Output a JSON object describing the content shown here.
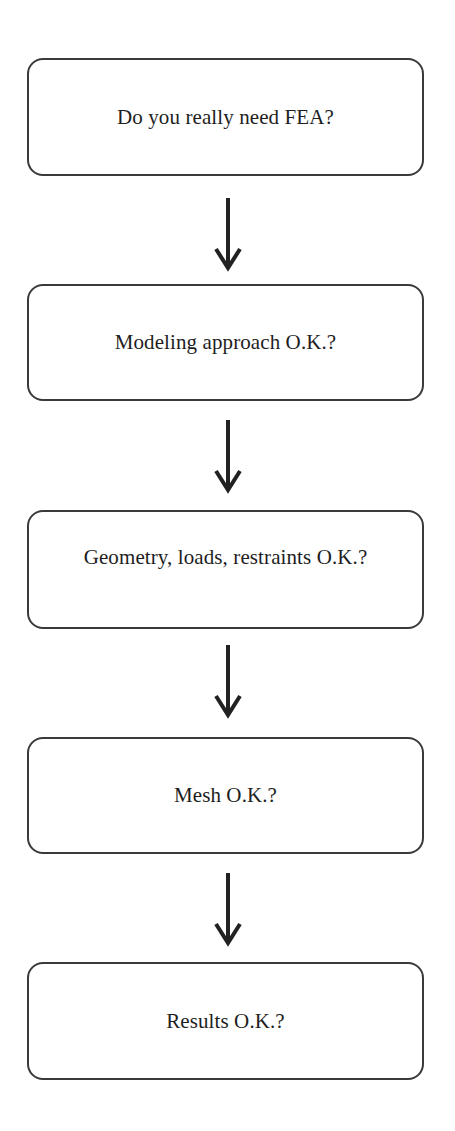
{
  "diagram": {
    "type": "flowchart",
    "direction": "top-to-bottom",
    "steps": [
      {
        "label": "Do you really need FEA?"
      },
      {
        "label": "Modeling approach O.K.?"
      },
      {
        "label": "Geometry, loads, restraints O.K.?"
      },
      {
        "label": "Mesh O.K.?"
      },
      {
        "label": "Results O.K.?"
      }
    ],
    "connectors": [
      {
        "from": 0,
        "to": 1,
        "icon": "down-arrow-icon"
      },
      {
        "from": 1,
        "to": 2,
        "icon": "down-arrow-icon"
      },
      {
        "from": 2,
        "to": 3,
        "icon": "down-arrow-icon"
      },
      {
        "from": 3,
        "to": 4,
        "icon": "down-arrow-icon"
      }
    ],
    "colors": {
      "stroke": "#3a3a3a",
      "text": "#1e1e1e",
      "background": "#ffffff"
    }
  }
}
